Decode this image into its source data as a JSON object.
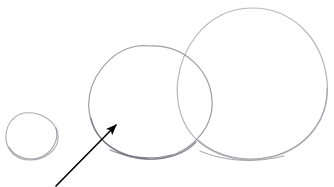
{
  "figure": {
    "medium": "pencil sketch / scanned line drawing",
    "background_color": "#ffffff",
    "width": 334,
    "height": 187,
    "caption": ""
  },
  "palette": {
    "background": "#ffffff",
    "pencil_light": "#b9b9bd",
    "pencil_mid": "#9a9aa0",
    "pencil_dark": "#7d7d84",
    "ink_black": "#000000"
  },
  "shapes": {
    "circles": [
      {
        "id": "circle-small",
        "label": "small circle",
        "order": 1,
        "center_x": 32,
        "center_y": 136,
        "radius_x": 26,
        "radius_y": 24,
        "stroke_color": "#a9a9af",
        "stroke_width": 1.1,
        "relative_size": "smallest"
      },
      {
        "id": "circle-medium",
        "label": "medium circle",
        "order": 2,
        "center_x": 151,
        "center_y": 103,
        "radius_x": 61,
        "radius_y": 57,
        "stroke_color": "#97979e",
        "stroke_width": 1.2,
        "relative_size": "medium"
      },
      {
        "id": "circle-large",
        "label": "large circle",
        "order": 3,
        "center_x": 252,
        "center_y": 84,
        "radius_x": 75,
        "radius_y": 76,
        "stroke_color": "#b2b2b8",
        "stroke_width": 1.2,
        "relative_size": "largest"
      }
    ],
    "overlap": {
      "id": "overlap-medium-large",
      "label": "lens-shaped overlap between medium and large circles",
      "intersection_top_x": 183,
      "intersection_top_y": 48,
      "intersection_bottom_x": 186,
      "intersection_bottom_y": 151
    },
    "arrow": {
      "id": "annotation-arrow",
      "label": "annotation arrow pointing to medium circle edge",
      "tail_x": 56,
      "tail_y": 186,
      "tip_x": 117,
      "tip_y": 124,
      "stroke_color": "#000000",
      "stroke_width": 1.6,
      "head_length": 15,
      "head_width": 9,
      "points_at": "circle-medium"
    }
  }
}
